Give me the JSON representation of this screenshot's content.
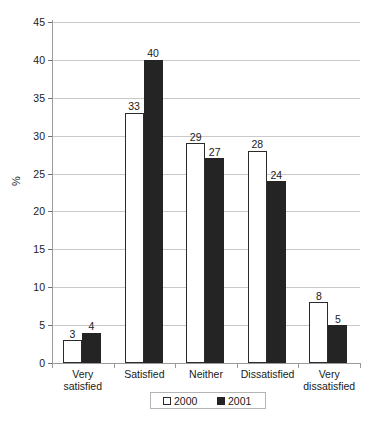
{
  "chart_data": {
    "type": "bar",
    "title": "",
    "subtitle": "",
    "xlabel": "",
    "ylabel": "%",
    "ylim": [
      0,
      45
    ],
    "ytick_step": 5,
    "yticks": [
      0,
      5,
      10,
      15,
      20,
      25,
      30,
      35,
      40,
      45
    ],
    "ytick_labels": [
      "0",
      "5",
      "10",
      "15",
      "20",
      "25",
      "30",
      "35",
      "40",
      "45"
    ],
    "grid": true,
    "grid_axis": "y",
    "legend_position": "bottom",
    "categories": [
      "Very  satisfied",
      "Satisfied",
      "Neither",
      "Dissatisfied",
      "Very\ndissatisfied"
    ],
    "category_lines": [
      [
        "Very  satisfied"
      ],
      [
        "Satisfied"
      ],
      [
        "Neither"
      ],
      [
        "Dissatisfied"
      ],
      [
        "Very",
        "dissatisfied"
      ]
    ],
    "series": [
      {
        "name": "2000",
        "color": "#ffffff",
        "edge_color": "#2b2b2b",
        "values": [
          3,
          33,
          29,
          28,
          8
        ],
        "labels": [
          "3",
          "33",
          "29",
          "28",
          "8"
        ]
      },
      {
        "name": "2001",
        "color": "#242424",
        "edge_color": "#242424",
        "values": [
          4,
          40,
          27,
          24,
          5
        ],
        "labels": [
          "4",
          "40",
          "27",
          "24",
          "5"
        ]
      }
    ]
  },
  "legend": {
    "entries": [
      {
        "label": "2000",
        "style": "hollow"
      },
      {
        "label": "2001",
        "style": "solid"
      }
    ]
  },
  "axis": {
    "y_title": "%"
  }
}
